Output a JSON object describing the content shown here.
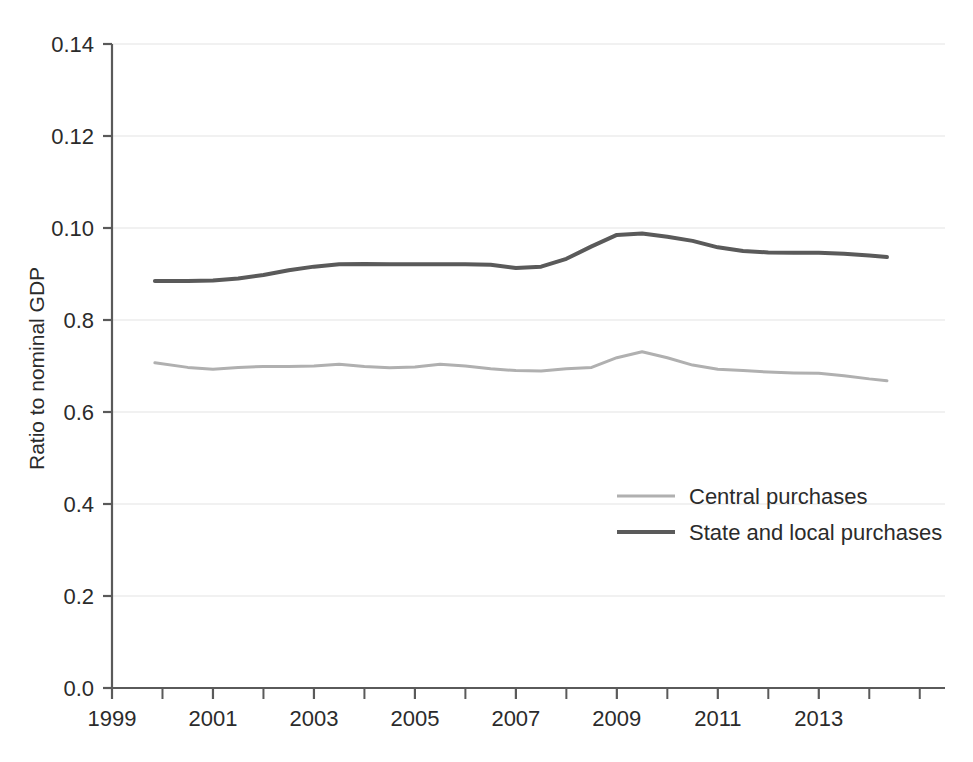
{
  "chart_data": {
    "type": "line",
    "title": "",
    "xlabel": "",
    "ylabel": "Ratio to nominal GDP",
    "xlim": [
      1999,
      2015.5
    ],
    "ylim": [
      0.0,
      0.14
    ],
    "grid": true,
    "legend_position": "center-right",
    "x_tick_labels": [
      "1999",
      "2001",
      "2003",
      "2005",
      "2007",
      "2009",
      "2011",
      "2013"
    ],
    "x_tick_values": [
      1999,
      2001,
      2003,
      2005,
      2007,
      2009,
      2011,
      2013
    ],
    "x_minor_tick_values": [
      2000,
      2002,
      2004,
      2006,
      2008,
      2010,
      2012,
      2014,
      2015
    ],
    "y_tick_labels": [
      "0.0",
      "0.2",
      "0.4",
      "0.6",
      "0.8",
      "0.10",
      "0.12",
      "0.14"
    ],
    "y_tick_values": [
      0.0,
      0.02,
      0.04,
      0.06,
      0.08,
      0.1,
      0.12,
      0.14
    ],
    "x": [
      1999.85,
      2000.5,
      2001.0,
      2001.5,
      2002.0,
      2002.5,
      2003.0,
      2003.5,
      2004.0,
      2004.5,
      2005.0,
      2005.5,
      2006.0,
      2006.5,
      2007.0,
      2007.5,
      2008.0,
      2008.5,
      2009.0,
      2009.5,
      2010.0,
      2010.5,
      2011.0,
      2011.5,
      2012.0,
      2012.5,
      2013.0,
      2013.5,
      2014.0,
      2014.35
    ],
    "series": [
      {
        "name": "Central purchases",
        "color": "#b0b0b0",
        "width": 3,
        "values": [
          0.0707,
          0.0697,
          0.0693,
          0.0697,
          0.0699,
          0.0699,
          0.07,
          0.0704,
          0.0699,
          0.0696,
          0.0698,
          0.0704,
          0.07,
          0.0694,
          0.069,
          0.0689,
          0.0694,
          0.0697,
          0.0718,
          0.0731,
          0.0718,
          0.0702,
          0.0693,
          0.069,
          0.0687,
          0.0685,
          0.0684,
          0.0679,
          0.0672,
          0.0668
        ]
      },
      {
        "name": "State and local purchases",
        "color": "#5a5a5a",
        "width": 4,
        "values": [
          0.0885,
          0.0885,
          0.0886,
          0.089,
          0.0898,
          0.0908,
          0.0916,
          0.0921,
          0.0922,
          0.0921,
          0.0921,
          0.0921,
          0.0921,
          0.092,
          0.0913,
          0.0916,
          0.0933,
          0.096,
          0.0985,
          0.0988,
          0.0981,
          0.0972,
          0.0958,
          0.095,
          0.0947,
          0.0946,
          0.0946,
          0.0944,
          0.094,
          0.0937
        ]
      }
    ],
    "legend": [
      {
        "label": "Central purchases",
        "color": "#b0b0b0",
        "width": 3
      },
      {
        "label": "State and local purchases",
        "color": "#5a5a5a",
        "width": 4
      }
    ],
    "colors": {
      "axis": "#5a5a5a",
      "grid": "#ededed",
      "text": "#2b2b2b",
      "background": "#ffffff",
      "central": "#b0b0b0",
      "state_local": "#5a5a5a"
    }
  }
}
